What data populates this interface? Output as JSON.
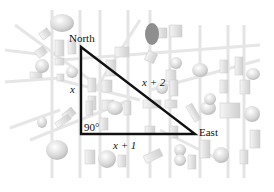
{
  "diagram": {
    "type": "right-triangle-over-map",
    "background": "faded city street map",
    "vertices": {
      "north": {
        "label": "North",
        "x": 81,
        "y": 47
      },
      "corner": {
        "label": "90°",
        "x": 81,
        "y": 134
      },
      "east": {
        "label": "East",
        "x": 195,
        "y": 134
      }
    },
    "sides": {
      "vertical": {
        "label": "x"
      },
      "horizontal": {
        "label": "x + 1"
      },
      "hypotenuse": {
        "label": "x + 2"
      }
    },
    "colors": {
      "triangle_stroke": "#111111",
      "map_lines": "#e2e2e2",
      "map_blocks": "#d6d6d6",
      "map_trees": "#cfcfcf",
      "dark_tree": "#8a8a8a"
    }
  }
}
